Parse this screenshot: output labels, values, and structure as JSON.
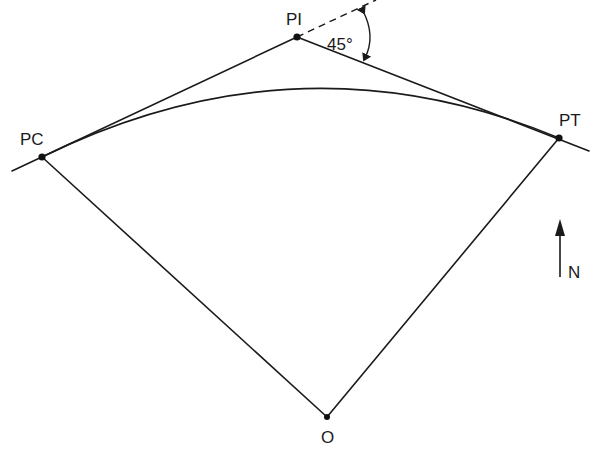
{
  "diagram": {
    "points": {
      "PI": {
        "label": "PI",
        "x": 297,
        "y": 37
      },
      "PC": {
        "label": "PC",
        "x": 42,
        "y": 157
      },
      "PT": {
        "label": "PT",
        "x": 559,
        "y": 138
      },
      "O": {
        "label": "O",
        "x": 327,
        "y": 417
      }
    },
    "deflection_angle": {
      "label": "45°",
      "value_degrees": 45
    },
    "north_arrow": {
      "label": "N"
    },
    "elements": [
      "back tangent (PC to PI)",
      "forward tangent (PI to PT)",
      "dashed extension of back tangent beyond PI",
      "circular arc from PC to PT",
      "radius O to PC",
      "radius O to PT",
      "deflection angle arc with arrowheads"
    ],
    "colors": {
      "line": "#1a1a1a",
      "background": "#ffffff"
    }
  }
}
